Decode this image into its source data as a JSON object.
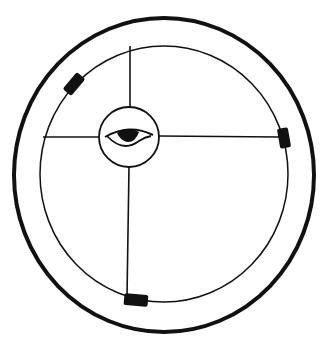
{
  "diagram": {
    "type": "wheel-with-eye",
    "colors": {
      "stroke": "#111111",
      "fill": "#111111",
      "background": "#ffffff"
    },
    "outer_ring": {
      "cx": 164,
      "cy": 175,
      "rx": 150,
      "ry": 157,
      "stroke_width": 4
    },
    "inner_ring": {
      "cx": 164,
      "cy": 174,
      "rx": 124,
      "ry": 128,
      "stroke_width": 1.5
    },
    "hub": {
      "cx": 129,
      "cy": 137,
      "r": 30,
      "icon": "eye-icon"
    },
    "spokes": [
      {
        "name": "spoke-top",
        "x1": 130,
        "y1": 46,
        "x2": 130,
        "y2": 107
      },
      {
        "name": "spoke-left",
        "x1": 43,
        "y1": 137,
        "x2": 99,
        "y2": 137
      },
      {
        "name": "spoke-right",
        "x1": 159,
        "y1": 136,
        "x2": 280,
        "y2": 137
      },
      {
        "name": "spoke-bottom",
        "x1": 129,
        "y1": 167,
        "x2": 127,
        "y2": 297
      }
    ],
    "markers": [
      {
        "name": "marker-upper-left",
        "cx": 74,
        "cy": 84,
        "w": 22,
        "h": 11,
        "angle": -50
      },
      {
        "name": "marker-right",
        "cx": 284,
        "cy": 138,
        "w": 20,
        "h": 11,
        "angle": 80
      },
      {
        "name": "marker-bottom",
        "cx": 136,
        "cy": 300,
        "w": 24,
        "h": 12,
        "angle": 5
      }
    ]
  }
}
